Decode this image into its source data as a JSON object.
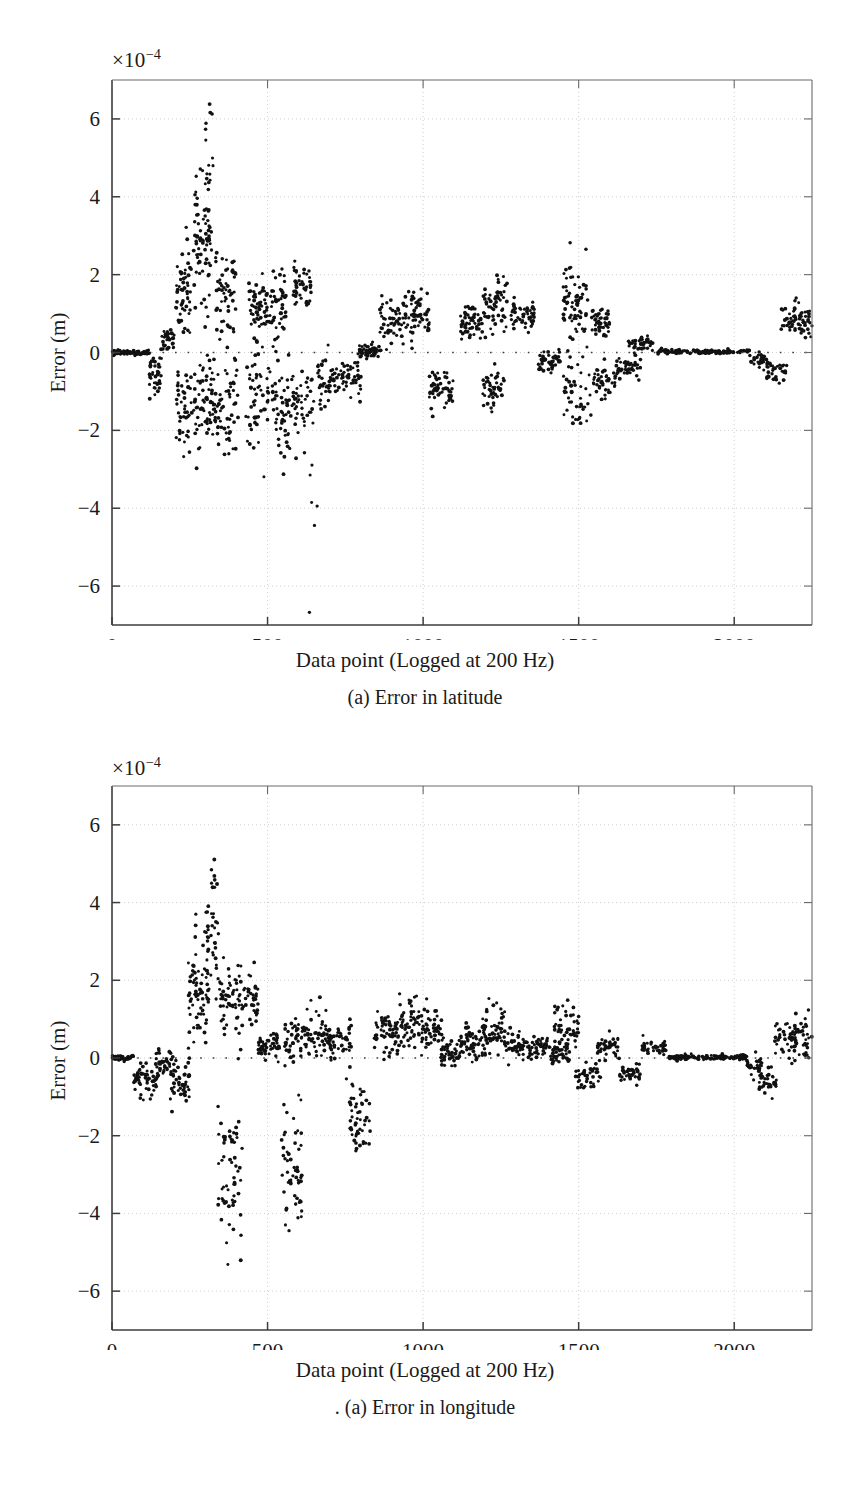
{
  "figure": {
    "panels": [
      {
        "id": "latitude",
        "caption": "(a) Error in latitude",
        "multiplier": "×10",
        "multiplier_exponent": "−4",
        "xlabel": "Data point (Logged at 200 Hz)",
        "ylabel": "Error (m)"
      },
      {
        "id": "longitude",
        "caption": ". (a) Error in longitude",
        "multiplier": "×10",
        "multiplier_exponent": "−4",
        "xlabel": "Data point (Logged at 200 Hz)",
        "ylabel": "Error (m)"
      }
    ]
  },
  "chart_data": [
    {
      "type": "scatter",
      "title": "(a) Error in latitude",
      "xlabel": "Data point (Logged at 200 Hz)",
      "ylabel": "Error (m)",
      "y_multiplier": 0.0001,
      "y_multiplier_label": "×10⁻⁴",
      "xlim": [
        0,
        2250
      ],
      "ylim": [
        -7,
        7
      ],
      "xticks": [
        0,
        500,
        1000,
        1500,
        2000
      ],
      "yticks": [
        -6,
        -4,
        -2,
        0,
        2,
        4,
        6
      ],
      "grid": true,
      "legend": null,
      "marker": "dot",
      "marker_color": "#111111",
      "zero_line": true,
      "clusters": [
        {
          "x0": 0,
          "x1": 120,
          "n": 70,
          "ymean": 0.0,
          "yspread": 0.03
        },
        {
          "x0": 120,
          "x1": 160,
          "n": 40,
          "ymean": -0.55,
          "yspread": 0.3
        },
        {
          "x0": 160,
          "x1": 200,
          "n": 35,
          "ymean": 0.35,
          "yspread": 0.18
        },
        {
          "x0": 205,
          "x1": 255,
          "n": 55,
          "ymean": 1.45,
          "yspread": 0.55
        },
        {
          "x0": 205,
          "x1": 260,
          "n": 45,
          "ymean": -1.45,
          "yspread": 0.6
        },
        {
          "x0": 262,
          "x1": 320,
          "n": 80,
          "ymean": 2.9,
          "yspread": 1.05
        },
        {
          "x0": 262,
          "x1": 330,
          "n": 70,
          "ymean": -1.25,
          "yspread": 0.55
        },
        {
          "x0": 300,
          "x1": 330,
          "n": 12,
          "ymean": 5.2,
          "yspread": 0.75
        },
        {
          "x0": 330,
          "x1": 400,
          "n": 55,
          "ymean": 1.55,
          "yspread": 0.55
        },
        {
          "x0": 330,
          "x1": 405,
          "n": 60,
          "ymean": -1.4,
          "yspread": 0.65
        },
        {
          "x0": 440,
          "x1": 500,
          "n": 60,
          "ymean": 1.15,
          "yspread": 0.35
        },
        {
          "x0": 430,
          "x1": 505,
          "n": 55,
          "ymean": -1.3,
          "yspread": 0.7
        },
        {
          "x0": 505,
          "x1": 560,
          "n": 50,
          "ymean": 1.2,
          "yspread": 0.4
        },
        {
          "x0": 505,
          "x1": 575,
          "n": 55,
          "ymean": -1.5,
          "yspread": 0.65
        },
        {
          "x0": 580,
          "x1": 640,
          "n": 45,
          "ymean": 1.65,
          "yspread": 0.3
        },
        {
          "x0": 575,
          "x1": 650,
          "n": 45,
          "ymean": -1.35,
          "yspread": 0.55
        },
        {
          "x0": 630,
          "x1": 660,
          "n": 6,
          "ymean": -4.6,
          "yspread": 0.95
        },
        {
          "x0": 660,
          "x1": 730,
          "n": 50,
          "ymean": -0.7,
          "yspread": 0.3
        },
        {
          "x0": 735,
          "x1": 800,
          "n": 45,
          "ymean": -0.65,
          "yspread": 0.25
        },
        {
          "x0": 790,
          "x1": 860,
          "n": 55,
          "ymean": 0.05,
          "yspread": 0.1
        },
        {
          "x0": 860,
          "x1": 940,
          "n": 55,
          "ymean": 0.8,
          "yspread": 0.3
        },
        {
          "x0": 940,
          "x1": 1020,
          "n": 60,
          "ymean": 1.0,
          "yspread": 0.4
        },
        {
          "x0": 1020,
          "x1": 1100,
          "n": 55,
          "ymean": -0.95,
          "yspread": 0.3
        },
        {
          "x0": 1120,
          "x1": 1190,
          "n": 55,
          "ymean": 0.8,
          "yspread": 0.25
        },
        {
          "x0": 1190,
          "x1": 1270,
          "n": 60,
          "ymean": 1.25,
          "yspread": 0.35
        },
        {
          "x0": 1190,
          "x1": 1260,
          "n": 45,
          "ymean": -0.9,
          "yspread": 0.25
        },
        {
          "x0": 1280,
          "x1": 1360,
          "n": 50,
          "ymean": 0.95,
          "yspread": 0.2
        },
        {
          "x0": 1370,
          "x1": 1440,
          "n": 45,
          "ymean": -0.2,
          "yspread": 0.15
        },
        {
          "x0": 1450,
          "x1": 1530,
          "n": 70,
          "ymean": 1.3,
          "yspread": 0.6
        },
        {
          "x0": 1450,
          "x1": 1540,
          "n": 45,
          "ymean": -1.05,
          "yspread": 0.4
        },
        {
          "x0": 1540,
          "x1": 1600,
          "n": 45,
          "ymean": 0.85,
          "yspread": 0.2
        },
        {
          "x0": 1545,
          "x1": 1620,
          "n": 45,
          "ymean": -0.75,
          "yspread": 0.25
        },
        {
          "x0": 1620,
          "x1": 1700,
          "n": 45,
          "ymean": -0.35,
          "yspread": 0.12
        },
        {
          "x0": 1660,
          "x1": 1740,
          "n": 40,
          "ymean": 0.25,
          "yspread": 0.1
        },
        {
          "x0": 1745,
          "x1": 2050,
          "n": 130,
          "ymean": 0.02,
          "yspread": 0.03
        },
        {
          "x0": 2050,
          "x1": 2110,
          "n": 30,
          "ymean": -0.18,
          "yspread": 0.12
        },
        {
          "x0": 2100,
          "x1": 2170,
          "n": 35,
          "ymean": -0.5,
          "yspread": 0.15
        },
        {
          "x0": 2150,
          "x1": 2200,
          "n": 30,
          "ymean": 0.9,
          "yspread": 0.25
        },
        {
          "x0": 2195,
          "x1": 2250,
          "n": 35,
          "ymean": 0.85,
          "yspread": 0.22
        }
      ]
    },
    {
      "type": "scatter",
      "title": ". (a) Error in longitude",
      "xlabel": "Data point (Logged at 200 Hz)",
      "ylabel": "Error (m)",
      "y_multiplier": 0.0001,
      "y_multiplier_label": "×10⁻⁴",
      "xlim": [
        0,
        2250
      ],
      "ylim": [
        -7,
        7
      ],
      "xticks": [
        0,
        500,
        1000,
        1500,
        2000
      ],
      "yticks": [
        -6,
        -4,
        -2,
        0,
        2,
        4,
        6
      ],
      "grid": true,
      "legend": null,
      "marker": "dot",
      "marker_color": "#111111",
      "zero_line": true,
      "clusters": [
        {
          "x0": 0,
          "x1": 70,
          "n": 45,
          "ymean": 0.0,
          "yspread": 0.03
        },
        {
          "x0": 70,
          "x1": 140,
          "n": 50,
          "ymean": -0.55,
          "yspread": 0.25
        },
        {
          "x0": 140,
          "x1": 190,
          "n": 40,
          "ymean": -0.15,
          "yspread": 0.2
        },
        {
          "x0": 185,
          "x1": 250,
          "n": 50,
          "ymean": -0.6,
          "yspread": 0.3
        },
        {
          "x0": 245,
          "x1": 310,
          "n": 75,
          "ymean": 1.75,
          "yspread": 0.75
        },
        {
          "x0": 300,
          "x1": 345,
          "n": 35,
          "ymean": 2.75,
          "yspread": 0.8
        },
        {
          "x0": 318,
          "x1": 340,
          "n": 8,
          "ymean": 4.6,
          "yspread": 0.4
        },
        {
          "x0": 345,
          "x1": 420,
          "n": 60,
          "ymean": 1.6,
          "yspread": 0.55
        },
        {
          "x0": 340,
          "x1": 420,
          "n": 60,
          "ymean": -2.7,
          "yspread": 0.9
        },
        {
          "x0": 420,
          "x1": 470,
          "n": 35,
          "ymean": 1.55,
          "yspread": 0.4
        },
        {
          "x0": 470,
          "x1": 540,
          "n": 55,
          "ymean": 0.3,
          "yspread": 0.18
        },
        {
          "x0": 545,
          "x1": 610,
          "n": 55,
          "ymean": -2.7,
          "yspread": 0.8
        },
        {
          "x0": 555,
          "x1": 625,
          "n": 50,
          "ymean": 0.55,
          "yspread": 0.3
        },
        {
          "x0": 625,
          "x1": 700,
          "n": 55,
          "ymean": 0.6,
          "yspread": 0.3
        },
        {
          "x0": 700,
          "x1": 770,
          "n": 50,
          "ymean": 0.45,
          "yspread": 0.25
        },
        {
          "x0": 760,
          "x1": 830,
          "n": 50,
          "ymean": -1.55,
          "yspread": 0.4
        },
        {
          "x0": 840,
          "x1": 920,
          "n": 60,
          "ymean": 0.65,
          "yspread": 0.3
        },
        {
          "x0": 920,
          "x1": 1000,
          "n": 65,
          "ymean": 0.8,
          "yspread": 0.35
        },
        {
          "x0": 1000,
          "x1": 1070,
          "n": 50,
          "ymean": 0.65,
          "yspread": 0.3
        },
        {
          "x0": 1050,
          "x1": 1120,
          "n": 45,
          "ymean": 0.1,
          "yspread": 0.15
        },
        {
          "x0": 1120,
          "x1": 1200,
          "n": 55,
          "ymean": 0.45,
          "yspread": 0.25
        },
        {
          "x0": 1190,
          "x1": 1270,
          "n": 60,
          "ymean": 0.7,
          "yspread": 0.35
        },
        {
          "x0": 1260,
          "x1": 1330,
          "n": 50,
          "ymean": 0.35,
          "yspread": 0.2
        },
        {
          "x0": 1330,
          "x1": 1400,
          "n": 45,
          "ymean": 0.3,
          "yspread": 0.15
        },
        {
          "x0": 1400,
          "x1": 1470,
          "n": 45,
          "ymean": 0.15,
          "yspread": 0.15
        },
        {
          "x0": 1420,
          "x1": 1500,
          "n": 50,
          "ymean": 0.7,
          "yspread": 0.35
        },
        {
          "x0": 1490,
          "x1": 1570,
          "n": 45,
          "ymean": -0.45,
          "yspread": 0.15
        },
        {
          "x0": 1560,
          "x1": 1630,
          "n": 45,
          "ymean": 0.3,
          "yspread": 0.15
        },
        {
          "x0": 1630,
          "x1": 1700,
          "n": 40,
          "ymean": -0.4,
          "yspread": 0.12
        },
        {
          "x0": 1700,
          "x1": 1780,
          "n": 40,
          "ymean": 0.25,
          "yspread": 0.1
        },
        {
          "x0": 1790,
          "x1": 2040,
          "n": 120,
          "ymean": 0.02,
          "yspread": 0.03
        },
        {
          "x0": 2040,
          "x1": 2090,
          "n": 30,
          "ymean": -0.2,
          "yspread": 0.12
        },
        {
          "x0": 2080,
          "x1": 2140,
          "n": 35,
          "ymean": -0.6,
          "yspread": 0.18
        },
        {
          "x0": 2130,
          "x1": 2200,
          "n": 45,
          "ymean": 0.5,
          "yspread": 0.25
        },
        {
          "x0": 2190,
          "x1": 2250,
          "n": 35,
          "ymean": 0.55,
          "yspread": 0.3
        }
      ]
    }
  ]
}
